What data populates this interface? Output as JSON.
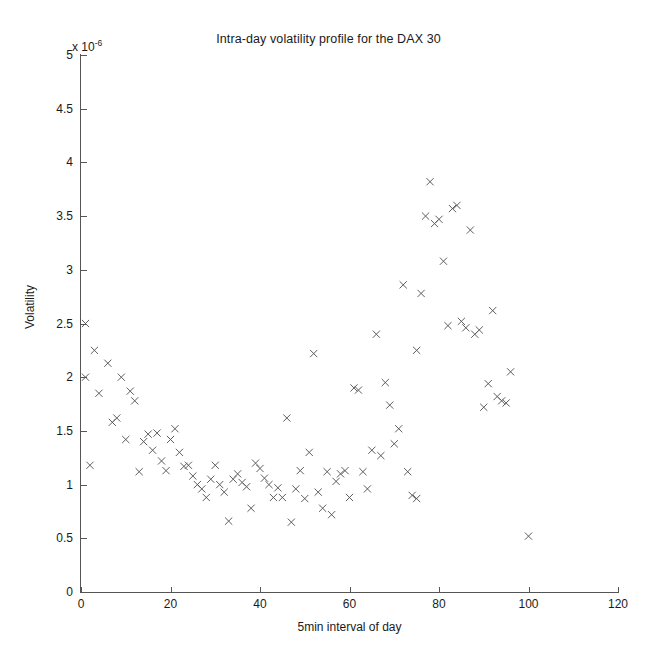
{
  "chart": {
    "title": "Intra-day volatility profile for the DAX 30",
    "xlabel": "5min interval of day",
    "ylabel": "Volatility",
    "exponent_prefix": "x 10",
    "exponent_power": "-6"
  },
  "chart_data": {
    "type": "scatter",
    "title": "Intra-day volatility profile for the DAX 30",
    "xlabel": "5min interval of day",
    "ylabel": "Volatility",
    "y_scale_exponent": -6,
    "y_scale_note": "x 10^-6",
    "xlim": [
      0,
      120
    ],
    "ylim": [
      0,
      5
    ],
    "xticks": [
      0,
      20,
      40,
      60,
      80,
      100,
      120
    ],
    "xtick_labels": [
      "0",
      "20",
      "40",
      "60",
      "80",
      "100",
      "120"
    ],
    "yticks": [
      0,
      0.5,
      1,
      1.5,
      2,
      2.5,
      3,
      3.5,
      4,
      4.5,
      5
    ],
    "ytick_labels": [
      "0",
      "0.5",
      "1",
      "1.5",
      "2",
      "2.5",
      "3",
      "3.5",
      "4",
      "4.5",
      "5"
    ],
    "grid": false,
    "legend": false,
    "marker": "x",
    "marker_color": "#555555",
    "series": [
      {
        "name": "Volatility",
        "x": [
          1,
          1,
          2,
          3,
          4,
          6,
          7,
          8,
          9,
          10,
          11,
          12,
          13,
          14,
          15,
          16,
          17,
          18,
          19,
          20,
          21,
          22,
          23,
          24,
          25,
          26,
          27,
          28,
          29,
          30,
          31,
          32,
          33,
          34,
          35,
          36,
          37,
          38,
          39,
          40,
          41,
          42,
          43,
          44,
          45,
          46,
          47,
          48,
          49,
          50,
          51,
          52,
          53,
          54,
          55,
          56,
          57,
          58,
          59,
          60,
          61,
          62,
          63,
          64,
          65,
          66,
          67,
          68,
          69,
          70,
          71,
          72,
          73,
          74,
          75,
          75,
          76,
          77,
          78,
          79,
          80,
          81,
          82,
          83,
          84,
          85,
          86,
          87,
          88,
          89,
          90,
          91,
          92,
          93,
          94,
          95,
          96,
          100
        ],
        "y": [
          2.5,
          2.0,
          1.18,
          2.25,
          1.85,
          2.13,
          1.58,
          1.62,
          2.0,
          1.42,
          1.87,
          1.78,
          1.12,
          1.4,
          1.47,
          1.32,
          1.48,
          1.22,
          1.13,
          1.42,
          1.52,
          1.3,
          1.17,
          1.18,
          1.08,
          1.0,
          0.96,
          0.88,
          1.05,
          1.18,
          1.0,
          0.93,
          0.66,
          1.05,
          1.1,
          1.02,
          0.98,
          0.78,
          1.2,
          1.15,
          1.06,
          1.0,
          0.88,
          0.97,
          0.88,
          1.62,
          0.65,
          0.96,
          1.13,
          0.87,
          1.3,
          2.22,
          0.93,
          0.78,
          1.12,
          0.72,
          1.03,
          1.1,
          1.13,
          0.88,
          1.9,
          1.88,
          1.12,
          0.96,
          1.32,
          2.4,
          1.27,
          1.95,
          1.74,
          1.38,
          1.52,
          2.86,
          1.12,
          0.9,
          0.87,
          2.25,
          2.78,
          3.5,
          3.82,
          3.43,
          3.47,
          3.08,
          2.48,
          3.57,
          3.6,
          2.52,
          2.46,
          3.37,
          2.4,
          2.44,
          1.72,
          1.94,
          2.62,
          1.82,
          1.78,
          1.76,
          2.05,
          0.52
        ]
      }
    ]
  }
}
